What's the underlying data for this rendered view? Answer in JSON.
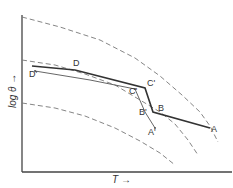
{
  "figure": {
    "type": "diagram",
    "axes": {
      "x_label": "T →",
      "y_label": "log θ →"
    },
    "colors": {
      "axis": "#444444",
      "dashed_curve": "#777777",
      "thick_path": "#333333",
      "thin_path": "#555555",
      "background": "#ffffff"
    },
    "dashed_curves": [
      {
        "name": "upper-dashed-curve",
        "points": "22,17 60,27 100,40 135,58 160,76 182,95 200,112 210,126 218,142"
      },
      {
        "name": "middle-dashed-curve",
        "points": "22,60 55,65 85,74 115,85 140,100 160,112 175,124 188,140 198,155"
      },
      {
        "name": "lower-dashed-curve",
        "points": "22,103 55,108 85,116 115,128 140,141 160,153 175,165"
      }
    ],
    "solid_paths": [
      {
        "name": "thick-path-DCBA",
        "points": "32,66 75,70 145,88 153,112 210,128"
      },
      {
        "name": "thin-path-DprimeCprimeBprimeAprime",
        "points": "35,71 90,80 125,87 135,89 145,112 155,128"
      }
    ],
    "point_labels": [
      {
        "name": "label-D",
        "text": "D",
        "x": 73,
        "y": 66
      },
      {
        "name": "label-D-prime",
        "text": "D'",
        "x": 29,
        "y": 77
      },
      {
        "name": "label-C",
        "text": "C'",
        "x": 147,
        "y": 86
      },
      {
        "name": "label-C-prime",
        "text": "C'",
        "x": 129,
        "y": 94
      },
      {
        "name": "label-B",
        "text": "B",
        "x": 158,
        "y": 111
      },
      {
        "name": "label-B-prime",
        "text": "B'",
        "x": 139,
        "y": 115
      },
      {
        "name": "label-A",
        "text": "A",
        "x": 211,
        "y": 132
      },
      {
        "name": "label-A-prime",
        "text": "A'",
        "x": 148,
        "y": 135
      }
    ]
  }
}
